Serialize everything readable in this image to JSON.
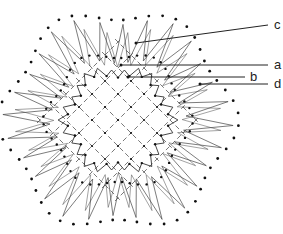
{
  "figure": {
    "type": "line-drawing",
    "stroke_color": "#333333",
    "dot_color": "#111111",
    "background": "#ffffff",
    "center": [
      118,
      120
    ],
    "outer_rays": 28,
    "inner_zigzag_points": 26
  },
  "labels": [
    {
      "id": "c",
      "text": "c",
      "x": 274,
      "y": 18,
      "leader": {
        "from": [
          136,
          43
        ],
        "to": [
          268,
          25
        ]
      }
    },
    {
      "id": "a",
      "text": "a",
      "x": 274,
      "y": 58,
      "leader": {
        "from": [
          121,
          65
        ],
        "to": [
          268,
          65
        ]
      }
    },
    {
      "id": "b",
      "text": "b",
      "x": 250,
      "y": 70,
      "leader": {
        "from": [
          128,
          77
        ],
        "to": [
          245,
          77
        ]
      }
    },
    {
      "id": "d",
      "text": "d",
      "x": 274,
      "y": 77,
      "leader": {
        "from": [
          200,
          84
        ],
        "to": [
          268,
          84
        ]
      }
    }
  ]
}
